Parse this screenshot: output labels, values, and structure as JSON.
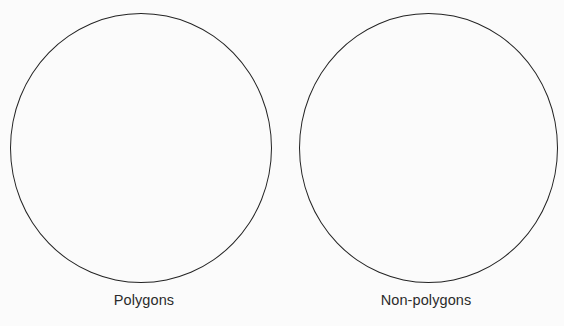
{
  "page": {
    "background_color": "#fbfbfb",
    "stroke_color": "#232323",
    "text_color": "#2b2b2b"
  },
  "sorting_diagram": {
    "type": "two-circle-sort",
    "groups": [
      {
        "id": "polygons",
        "label": "Polygons",
        "shape": "circle",
        "items": []
      },
      {
        "id": "non-polygons",
        "label": "Non-polygons",
        "shape": "circle",
        "items": []
      }
    ]
  }
}
